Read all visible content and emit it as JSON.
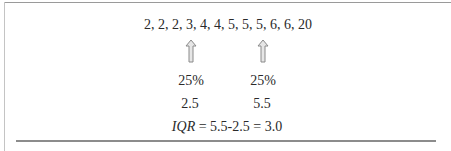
{
  "figure": {
    "data_series": "2, 2, 2, 3, 4, 4, 5, 5, 5, 6, 6, 20",
    "markers": [
      {
        "percent_label": "25%",
        "value_label": "2.5",
        "icon": "up-arrow-icon"
      },
      {
        "percent_label": "25%",
        "value_label": "5.5",
        "icon": "up-arrow-icon"
      }
    ],
    "formula": {
      "variable": "IQR",
      "expression": " = 5.5-2.5 = 3.0"
    }
  }
}
